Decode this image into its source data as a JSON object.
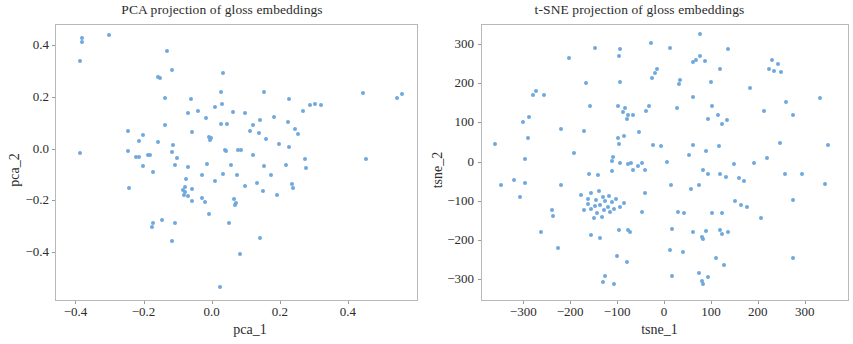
{
  "chart_data": [
    {
      "type": "scatter",
      "id": "pca",
      "title": "PCA projection of gloss embeddings",
      "xlabel": "pca_1",
      "ylabel": "pca_2",
      "xlim": [
        -0.46,
        0.6
      ],
      "ylim": [
        -0.58,
        0.48
      ],
      "xticks": [
        -0.4,
        -0.2,
        0.0,
        0.2,
        0.4
      ],
      "xtick_labels": [
        "−0.4",
        "−0.2",
        "0.0",
        "0.2",
        "0.4"
      ],
      "yticks": [
        -0.4,
        -0.2,
        0.0,
        0.2,
        0.4
      ],
      "ytick_labels": [
        "−0.4",
        "−0.2",
        "0.0",
        "0.2",
        "0.4"
      ],
      "grid": false,
      "legend": null,
      "marker_color": "#6fa8dc",
      "marker_size": 4,
      "n_points": 110,
      "points": [
        [
          -0.385,
          0.43
        ],
        [
          -0.385,
          0.415
        ],
        [
          -0.305,
          0.44
        ],
        [
          -0.39,
          0.34
        ],
        [
          -0.135,
          0.38
        ],
        [
          -0.12,
          0.305
        ],
        [
          -0.16,
          0.28
        ],
        [
          -0.155,
          0.275
        ],
        [
          0.03,
          0.295
        ],
        [
          0.025,
          0.22
        ],
        [
          0.028,
          0.175
        ],
        [
          -0.065,
          0.195
        ],
        [
          -0.072,
          0.14
        ],
        [
          0.06,
          0.145
        ],
        [
          0.15,
          0.222
        ],
        [
          0.225,
          0.193
        ],
        [
          0.265,
          0.148
        ],
        [
          0.3,
          0.175
        ],
        [
          0.318,
          0.172
        ],
        [
          0.285,
          0.173
        ],
        [
          0.44,
          0.218
        ],
        [
          0.54,
          0.2
        ],
        [
          0.555,
          0.213
        ],
        [
          0.025,
          0.1
        ],
        [
          0.042,
          0.1
        ],
        [
          0.14,
          0.112
        ],
        [
          0.222,
          0.105
        ],
        [
          0.243,
          0.08
        ],
        [
          -0.25,
          0.072
        ],
        [
          -0.06,
          0.068
        ],
        [
          0.11,
          0.072
        ],
        [
          0.135,
          0.063
        ],
        [
          -0.205,
          0.055
        ],
        [
          -0.215,
          0.032
        ],
        [
          -0.16,
          0.03
        ],
        [
          -0.115,
          0.018
        ],
        [
          -0.01,
          0.048
        ],
        [
          -0.005,
          0.043
        ],
        [
          -0.008,
          0.035
        ],
        [
          0.196,
          0.02
        ],
        [
          0.225,
          0.01
        ],
        [
          -0.39,
          -0.012
        ],
        [
          -0.12,
          -0.01
        ],
        [
          0.04,
          -0.005
        ],
        [
          0.035,
          0.0
        ],
        [
          0.075,
          -0.002
        ],
        [
          -0.19,
          -0.022
        ],
        [
          -0.185,
          -0.02
        ],
        [
          -0.215,
          -0.028
        ],
        [
          -0.225,
          -0.03
        ],
        [
          -0.105,
          -0.032
        ],
        [
          0.082,
          0.0
        ],
        [
          -0.205,
          -0.062
        ],
        [
          -0.072,
          -0.068
        ],
        [
          -0.018,
          -0.055
        ],
        [
          0.15,
          -0.062
        ],
        [
          0.272,
          -0.038
        ],
        [
          0.275,
          -0.072
        ],
        [
          0.45,
          -0.035
        ],
        [
          0.03,
          -0.095
        ],
        [
          0.072,
          -0.1
        ],
        [
          0.172,
          -0.1
        ],
        [
          -0.078,
          -0.112
        ],
        [
          0.232,
          -0.132
        ],
        [
          0.13,
          -0.13
        ],
        [
          -0.245,
          -0.148
        ],
        [
          -0.082,
          -0.145
        ],
        [
          -0.088,
          -0.155
        ],
        [
          -0.082,
          -0.165
        ],
        [
          -0.085,
          -0.175
        ],
        [
          -0.062,
          -0.152
        ],
        [
          0.235,
          -0.148
        ],
        [
          -0.072,
          -0.178
        ],
        [
          -0.03,
          -0.188
        ],
        [
          -0.06,
          -0.198
        ],
        [
          -0.022,
          -0.203
        ],
        [
          0.062,
          -0.192
        ],
        [
          0.068,
          -0.205
        ],
        [
          0.065,
          -0.215
        ],
        [
          0.148,
          -0.16
        ],
        [
          -0.01,
          -0.25
        ],
        [
          -0.15,
          -0.272
        ],
        [
          -0.175,
          -0.285
        ],
        [
          -0.178,
          -0.298
        ],
        [
          -0.11,
          -0.285
        ],
        [
          0.048,
          -0.285
        ],
        [
          0.14,
          -0.34
        ],
        [
          -0.118,
          -0.352
        ],
        [
          0.08,
          -0.402
        ],
        [
          0.022,
          -0.528
        ],
        [
          -0.14,
          0.2
        ],
        [
          -0.042,
          0.15
        ],
        [
          0.008,
          0.165
        ],
        [
          0.095,
          0.14
        ],
        [
          0.18,
          0.125
        ],
        [
          0.25,
          0.06
        ],
        [
          -0.14,
          0.095
        ],
        [
          -0.02,
          0.12
        ],
        [
          0.118,
          0.095
        ],
        [
          -0.175,
          -0.085
        ],
        [
          -0.112,
          -0.058
        ],
        [
          0.006,
          -0.12
        ],
        [
          0.095,
          -0.142
        ],
        [
          0.19,
          -0.175
        ],
        [
          0.215,
          -0.06
        ],
        [
          -0.03,
          -0.1
        ],
        [
          0.055,
          -0.06
        ],
        [
          0.118,
          -0.02
        ],
        [
          0.158,
          0.04
        ],
        [
          -0.25,
          -0.005
        ]
      ]
    },
    {
      "type": "scatter",
      "id": "tsne",
      "title": "t-SNE projection of gloss embeddings",
      "xlabel": "tsne_1",
      "ylabel": "tsne_2",
      "xlim": [
        -390,
        390
      ],
      "ylim": [
        -350,
        350
      ],
      "xticks": [
        -300,
        -200,
        -100,
        0,
        100,
        200,
        300
      ],
      "xtick_labels": [
        "−300",
        "−200",
        "−100",
        "0",
        "100",
        "200",
        "300"
      ],
      "yticks": [
        -300,
        -200,
        -100,
        0,
        100,
        200,
        300
      ],
      "ytick_labels": [
        "−300",
        "−200",
        "−100",
        "0",
        "100",
        "200",
        "300"
      ],
      "grid": false,
      "legend": null,
      "marker_color": "#6fa8dc",
      "marker_size": 4,
      "n_points": 152,
      "points": [
        [
          75,
          328
        ],
        [
          -30,
          305
        ],
        [
          -150,
          292
        ],
        [
          10,
          292
        ],
        [
          135,
          290
        ],
        [
          -95,
          288
        ],
        [
          -98,
          270
        ],
        [
          65,
          262
        ],
        [
          60,
          255
        ],
        [
          75,
          270
        ],
        [
          85,
          258
        ],
        [
          228,
          262
        ],
        [
          240,
          250
        ],
        [
          222,
          238
        ],
        [
          232,
          232
        ],
        [
          248,
          230
        ],
        [
          -205,
          265
        ],
        [
          -168,
          203
        ],
        [
          -95,
          205
        ],
        [
          -28,
          215
        ],
        [
          -22,
          228
        ],
        [
          -18,
          238
        ],
        [
          30,
          200
        ],
        [
          32,
          210
        ],
        [
          118,
          238
        ],
        [
          98,
          205
        ],
        [
          182,
          190
        ],
        [
          -258,
          172
        ],
        [
          -282,
          172
        ],
        [
          -275,
          182
        ],
        [
          -290,
          115
        ],
        [
          -302,
          103
        ],
        [
          -160,
          143
        ],
        [
          -100,
          145
        ],
        [
          -85,
          138
        ],
        [
          -90,
          128
        ],
        [
          -78,
          122
        ],
        [
          -82,
          112
        ],
        [
          -68,
          120
        ],
        [
          -35,
          145
        ],
        [
          -40,
          130
        ],
        [
          25,
          138
        ],
        [
          60,
          168
        ],
        [
          112,
          120
        ],
        [
          122,
          98
        ],
        [
          132,
          108
        ],
        [
          92,
          112
        ],
        [
          100,
          145
        ],
        [
          212,
          130
        ],
        [
          258,
          155
        ],
        [
          272,
          122
        ],
        [
          330,
          165
        ],
        [
          -222,
          85
        ],
        [
          -172,
          80
        ],
        [
          -55,
          78
        ],
        [
          -88,
          68
        ],
        [
          -100,
          62
        ],
        [
          -292,
          62
        ],
        [
          -362,
          48
        ],
        [
          -98,
          48
        ],
        [
          -25,
          45
        ],
        [
          -8,
          42
        ],
        [
          115,
          42
        ],
        [
          245,
          50
        ],
        [
          348,
          45
        ],
        [
          -195,
          25
        ],
        [
          -298,
          10
        ],
        [
          -112,
          5
        ],
        [
          -110,
          15
        ],
        [
          -95,
          -2
        ],
        [
          -78,
          -5
        ],
        [
          -72,
          0
        ],
        [
          -58,
          -8
        ],
        [
          -42,
          -18
        ],
        [
          -50,
          -2
        ],
        [
          5,
          2
        ],
        [
          52,
          18
        ],
        [
          60,
          45
        ],
        [
          88,
          30
        ],
        [
          148,
          -5
        ],
        [
          190,
          -2
        ],
        [
          218,
          12
        ],
        [
          -162,
          -30
        ],
        [
          -142,
          -32
        ],
        [
          -112,
          -22
        ],
        [
          -68,
          -18
        ],
        [
          80,
          -18
        ],
        [
          92,
          -28
        ],
        [
          118,
          -28
        ],
        [
          130,
          -38
        ],
        [
          158,
          -40
        ],
        [
          168,
          -48
        ],
        [
          255,
          -30
        ],
        [
          292,
          -28
        ],
        [
          342,
          -55
        ],
        [
          -350,
          -58
        ],
        [
          -322,
          -45
        ],
        [
          -298,
          -52
        ],
        [
          -222,
          -58
        ],
        [
          -310,
          -88
        ],
        [
          -178,
          -82
        ],
        [
          -165,
          -92
        ],
        [
          -158,
          -78
        ],
        [
          -148,
          -95
        ],
        [
          -140,
          -72
        ],
        [
          -132,
          -88
        ],
        [
          -128,
          -98
        ],
        [
          -120,
          -85
        ],
        [
          -112,
          -100
        ],
        [
          -105,
          -92
        ],
        [
          -122,
          -112
        ],
        [
          -138,
          -108
        ],
        [
          -150,
          -110
        ],
        [
          -158,
          -118
        ],
        [
          -145,
          -128
        ],
        [
          -130,
          -120
        ],
        [
          -118,
          -125
        ],
        [
          -108,
          -118
        ],
        [
          -95,
          -112
        ],
        [
          -88,
          -102
        ],
        [
          -165,
          -105
        ],
        [
          -172,
          -120
        ],
        [
          -135,
          -138
        ],
        [
          -152,
          -140
        ],
        [
          -42,
          -78
        ],
        [
          -48,
          -125
        ],
        [
          12,
          -58
        ],
        [
          28,
          -125
        ],
        [
          40,
          -128
        ],
        [
          55,
          -68
        ],
        [
          72,
          -58
        ],
        [
          100,
          -128
        ],
        [
          122,
          -128
        ],
        [
          150,
          -98
        ],
        [
          162,
          -108
        ],
        [
          175,
          -112
        ],
        [
          205,
          -140
        ],
        [
          272,
          -95
        ],
        [
          -240,
          -120
        ],
        [
          -238,
          -135
        ],
        [
          -265,
          -178
        ],
        [
          -158,
          -185
        ],
        [
          -138,
          -192
        ],
        [
          -228,
          -218
        ],
        [
          -98,
          -172
        ],
        [
          -78,
          -172
        ],
        [
          -75,
          -178
        ],
        [
          15,
          -168
        ],
        [
          60,
          -178
        ],
        [
          88,
          -175
        ],
        [
          78,
          -190
        ],
        [
          82,
          -195
        ],
        [
          118,
          -172
        ],
        [
          122,
          -182
        ],
        [
          135,
          -178
        ],
        [
          -102,
          -238
        ],
        [
          -82,
          -252
        ],
        [
          10,
          -222
        ],
        [
          38,
          -228
        ],
        [
          108,
          -242
        ],
        [
          125,
          -262
        ],
        [
          272,
          -242
        ],
        [
          -128,
          -288
        ],
        [
          -132,
          -305
        ],
        [
          -108,
          -308
        ],
        [
          15,
          -290
        ],
        [
          72,
          -282
        ],
        [
          92,
          -292
        ],
        [
          78,
          -302
        ],
        [
          82,
          -310
        ]
      ]
    }
  ]
}
